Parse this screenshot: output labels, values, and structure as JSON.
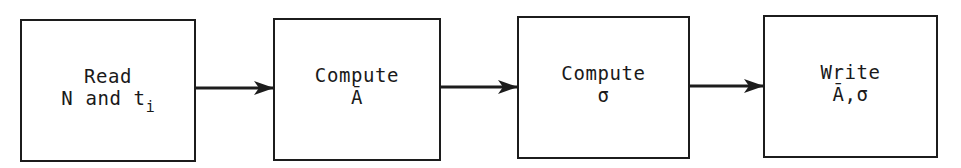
{
  "diagram": {
    "type": "flowchart",
    "direction": "left-to-right",
    "nodes": [
      {
        "id": "read",
        "line1": "Read",
        "line2_main": "N and t",
        "line2_sub": "i",
        "box": {
          "x": 20,
          "y": 19,
          "w": 176,
          "h": 143
        }
      },
      {
        "id": "compute-mean",
        "line1": "Compute",
        "line2": "Ā",
        "box": {
          "x": 273,
          "y": 18,
          "w": 168,
          "h": 143
        }
      },
      {
        "id": "compute-sigma",
        "line1": "Compute",
        "line2": "σ",
        "box": {
          "x": 517,
          "y": 16,
          "w": 173,
          "h": 143
        }
      },
      {
        "id": "write",
        "line1": "Write",
        "line2": "Ā,σ",
        "box": {
          "x": 763,
          "y": 15,
          "w": 175,
          "h": 143
        }
      }
    ],
    "edges": [
      {
        "from": "read",
        "to": "compute-mean"
      },
      {
        "from": "compute-mean",
        "to": "compute-sigma"
      },
      {
        "from": "compute-sigma",
        "to": "write"
      }
    ],
    "colors": {
      "stroke": "#1c1c1c",
      "background": "#ffffff"
    }
  }
}
